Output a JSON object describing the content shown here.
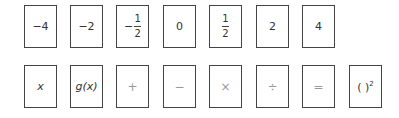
{
  "row1": {
    "cards": [
      {
        "label": "−4"
      },
      {
        "label": "−2"
      },
      {
        "sign": "−",
        "numerator": "1",
        "denominator": "2"
      },
      {
        "label": "0"
      },
      {
        "numerator": "1",
        "denominator": "2"
      },
      {
        "label": "2"
      },
      {
        "label": "4"
      }
    ]
  },
  "row2": {
    "cards": [
      {
        "label": "x"
      },
      {
        "label": "g(x)"
      },
      {
        "label": "+"
      },
      {
        "label": "−"
      },
      {
        "label": "×"
      },
      {
        "label": "÷"
      },
      {
        "label": "="
      },
      {
        "base": "( )",
        "exponent": "2"
      }
    ]
  }
}
